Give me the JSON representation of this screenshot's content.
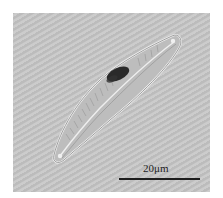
{
  "image": {
    "subject": "diatom micrograph",
    "background_color": "#c6c6c6",
    "scale_bar": {
      "label": "20μm",
      "color": "#1e1e1e"
    }
  }
}
